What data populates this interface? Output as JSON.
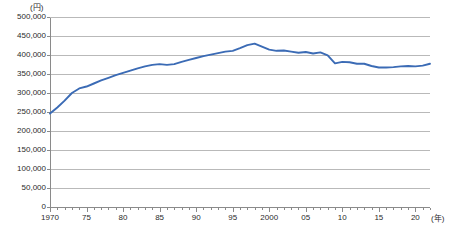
{
  "chart_data": {
    "type": "line",
    "title": "",
    "subtitle": "",
    "xlabel": "(年)",
    "ylabel": "(円)",
    "y_unit_label": "(円)",
    "x_unit_label": "(年)",
    "xlim": [
      1970,
      2022
    ],
    "ylim": [
      0,
      500000
    ],
    "grid": true,
    "grid_axis": "y",
    "legend": false,
    "legend_position": "none",
    "line_color": "#3b6bb5",
    "y_ticks": [
      0,
      50000,
      100000,
      150000,
      200000,
      250000,
      300000,
      350000,
      400000,
      450000,
      500000
    ],
    "y_tick_labels": [
      "0",
      "50,000",
      "100,000",
      "150,000",
      "200,000",
      "250,000",
      "300,000",
      "350,000",
      "400,000",
      "450,000",
      "500,000"
    ],
    "x_ticks": [
      1970,
      1975,
      1980,
      1985,
      1990,
      1995,
      2000,
      2005,
      2010,
      2015,
      2020
    ],
    "x_tick_labels": [
      "1970",
      "75",
      "80",
      "85",
      "90",
      "95",
      "2000",
      "05",
      "10",
      "15",
      "20"
    ],
    "x_minor_tick_interval": 1,
    "x": [
      1970,
      1971,
      1972,
      1973,
      1974,
      1975,
      1976,
      1977,
      1978,
      1979,
      1980,
      1981,
      1982,
      1983,
      1984,
      1985,
      1986,
      1987,
      1988,
      1989,
      1990,
      1991,
      1992,
      1993,
      1994,
      1995,
      1996,
      1997,
      1998,
      1999,
      2000,
      2001,
      2002,
      2003,
      2004,
      2005,
      2006,
      2007,
      2008,
      2009,
      2010,
      2011,
      2012,
      2013,
      2014,
      2015,
      2016,
      2017,
      2018,
      2019,
      2020,
      2021,
      2022
    ],
    "series": [
      {
        "name": "金額",
        "color": "#3b6bb5",
        "values": [
          246000,
          262000,
          280000,
          300000,
          312000,
          317000,
          325000,
          333000,
          340000,
          347000,
          353000,
          359000,
          365000,
          370000,
          374000,
          376000,
          374000,
          376000,
          382000,
          387000,
          392000,
          397000,
          401000,
          405000,
          409000,
          411000,
          418000,
          426000,
          430000,
          422000,
          414000,
          411000,
          412000,
          409000,
          406000,
          408000,
          404000,
          407000,
          399000,
          378000,
          382000,
          381000,
          377000,
          377000,
          371000,
          367000,
          367000,
          368000,
          370000,
          371000,
          370000,
          372000,
          377000
        ]
      }
    ],
    "annotations": []
  },
  "geometry": {
    "plot_left": 50,
    "plot_right": 430,
    "plot_top": 17,
    "plot_bottom": 207
  }
}
